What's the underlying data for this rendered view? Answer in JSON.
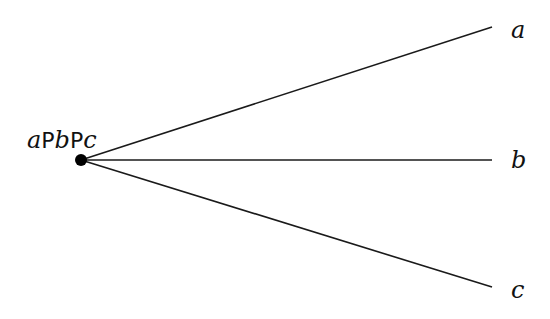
{
  "diagram": {
    "type": "tree-branching",
    "root": {
      "label_parts": [
        "a",
        "P",
        "b",
        "P",
        "c"
      ],
      "label": "aPbPc",
      "x": 81,
      "y": 160
    },
    "leaves": [
      {
        "label": "a",
        "x": 492,
        "y": 27
      },
      {
        "label": "b",
        "x": 492,
        "y": 160
      },
      {
        "label": "c",
        "x": 492,
        "y": 287
      }
    ],
    "colors": {
      "line": "#1a1a1a",
      "node": "#000000",
      "text": "#111111",
      "background": "#ffffff"
    }
  }
}
